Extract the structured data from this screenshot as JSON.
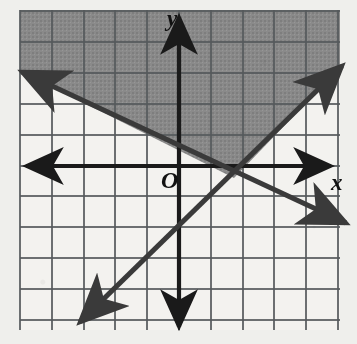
{
  "figure": {
    "kind": "coordinate-plane-inequality-graph",
    "background_color": "#efefec",
    "plot_area": {
      "left": 20,
      "top": 10,
      "right": 340,
      "bottom": 330
    },
    "grid": {
      "visible": true,
      "color": "#55595c",
      "spacing_px_x": 31.8,
      "spacing_px_y": 30.6,
      "x_lines_px": [
        20,
        52,
        84,
        115,
        147,
        179,
        211,
        243,
        274,
        306,
        338
      ],
      "y_lines_px": [
        11,
        42,
        73,
        104,
        135,
        166,
        196,
        227,
        258,
        289,
        320
      ]
    },
    "origin_px": {
      "x": 179,
      "y": 166
    },
    "axes": {
      "x_axis_label": "x",
      "y_axis_label": "y",
      "origin_label": "O",
      "color": "#1a1a1a",
      "x_axis_y_px": 166,
      "y_axis_x_px": 179,
      "double_arrow": true
    },
    "labels": {
      "origin": {
        "text": "O",
        "x": 161,
        "y": 188
      },
      "x": {
        "text": "x",
        "x": 331,
        "y": 190
      },
      "y": {
        "text": "y",
        "x": 167,
        "y": 26
      }
    }
  },
  "chart_data": {
    "type": "line",
    "title": "",
    "xlabel": "x",
    "ylabel": "y",
    "grid": true,
    "legend": false,
    "xlim": [
      -5,
      5
    ],
    "ylim": [
      -5,
      5
    ],
    "origin_label": "O",
    "shaded_region": {
      "description": "Region above both boundary lines (V-shaped wedge opening upward)",
      "fill_color": "#8a8a8a",
      "fill_opacity": 1,
      "boundary_style": "solid",
      "included": true
    },
    "series": [
      {
        "name": "descending-line",
        "type": "line",
        "slope": -0.5,
        "intercept": 0.45,
        "color": "#3a3a3a",
        "style": "solid",
        "arrows": "both",
        "endpoints_px": [
          [
            22,
            72
          ],
          [
            346,
            223
          ]
        ],
        "points": [
          [
            -5,
            2.95
          ],
          [
            0,
            0.45
          ],
          [
            5,
            -2.05
          ]
        ]
      },
      {
        "name": "ascending-line",
        "type": "line",
        "slope": 1.0,
        "intercept": -2.0,
        "color": "#3a3a3a",
        "style": "solid",
        "arrows": "both",
        "endpoints_px": [
          [
            80,
            322
          ],
          [
            342,
            66
          ]
        ],
        "points": [
          [
            -3.2,
            -5.2
          ],
          [
            0,
            -2.0
          ],
          [
            5,
            3.0
          ]
        ]
      }
    ],
    "intersection_point": {
      "x": 1.7,
      "y": -0.4,
      "px": [
        234,
        178
      ]
    }
  }
}
